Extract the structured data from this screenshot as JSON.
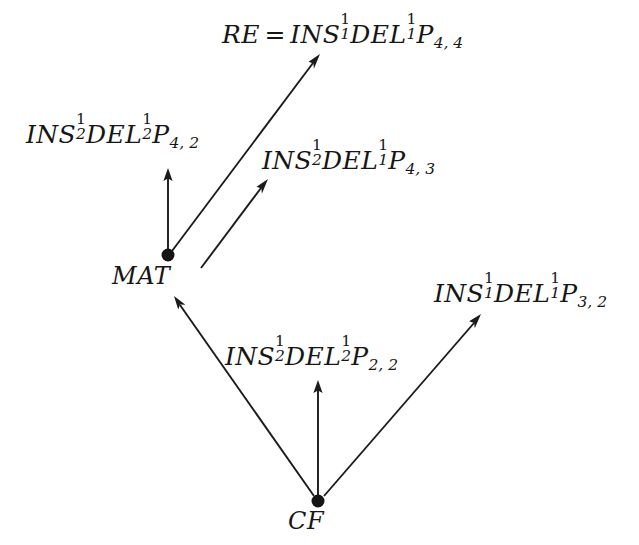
{
  "diagram": {
    "background_color": "#ffffff",
    "ink_color": "#161616",
    "nodes": [
      {
        "id": "MAT",
        "label": "MAT",
        "x": 168,
        "y": 255
      },
      {
        "id": "CF",
        "label": "CF",
        "x": 318,
        "y": 501
      }
    ],
    "labels": {
      "top": {
        "text": "RE = INS_1^1 DEL_1^1 P_{4,4}",
        "lhs": "RE",
        "equals": "=",
        "ins": "INS",
        "ins_sup": "1",
        "ins_sub": "1",
        "del": "DEL",
        "del_sup": "1",
        "del_sub": "1",
        "p": "P",
        "p_sub": "4, 4"
      },
      "upper_left": {
        "text": "INS_2^1 DEL_2^1 P_{4,2}",
        "ins": "INS",
        "ins_sup": "1",
        "ins_sub": "2",
        "del": "DEL",
        "del_sup": "1",
        "del_sub": "2",
        "p": "P",
        "p_sub": "4, 2"
      },
      "middle_right": {
        "text": "INS_2^1 DEL_1^1 P_{4,3}",
        "ins": "INS",
        "ins_sup": "1",
        "ins_sub": "2",
        "del": "DEL",
        "del_sup": "1",
        "del_sub": "1",
        "p": "P",
        "p_sub": "4, 3"
      },
      "right": {
        "text": "INS_1^1 DEL_1^1 P_{3,2}",
        "ins": "INS",
        "ins_sup": "1",
        "ins_sub": "1",
        "del": "DEL",
        "del_sup": "1",
        "del_sub": "1",
        "p": "P",
        "p_sub": "3, 2"
      },
      "center_bottom": {
        "text": "INS_2^1 DEL_2^1 P_{2,2}",
        "ins": "INS",
        "ins_sup": "1",
        "ins_sub": "2",
        "del": "DEL",
        "del_sup": "1",
        "del_sub": "2",
        "p": "P",
        "p_sub": "2, 2"
      }
    },
    "edges": [
      {
        "name": "mat-to-upper-left",
        "from": "MAT",
        "to": "upper_left",
        "kind": "vertical-arrow"
      },
      {
        "name": "mat-to-top",
        "from": "MAT",
        "to": "top",
        "kind": "diagonal-arrow"
      },
      {
        "name": "mat-to-middle-right",
        "from": "MAT",
        "to": "middle_right",
        "kind": "diagonal-arrow"
      },
      {
        "name": "cf-to-mat",
        "from": "CF",
        "to": "MAT",
        "kind": "diagonal-arrow"
      },
      {
        "name": "cf-to-center-bottom",
        "from": "CF",
        "to": "center_bottom",
        "kind": "vertical-arrow"
      },
      {
        "name": "cf-to-right",
        "from": "CF",
        "to": "right",
        "kind": "diagonal-arrow"
      }
    ]
  }
}
